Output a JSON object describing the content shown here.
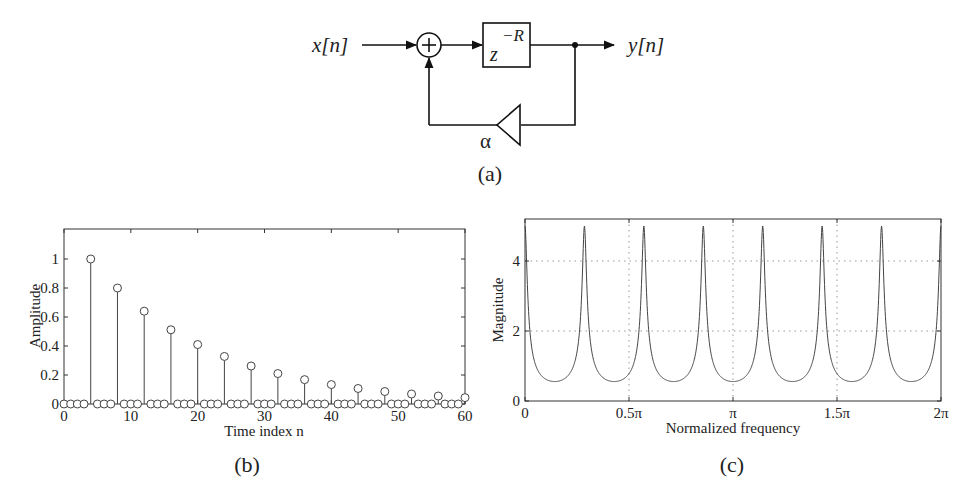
{
  "diagram": {
    "input_label": "x[n]",
    "output_label": "y[n]",
    "delay_label_base": "z",
    "delay_label_exp": "−R",
    "adder_symbol": "+",
    "gain_label": "α",
    "caption": "(a)"
  },
  "panel_b": {
    "caption": "(b)",
    "xlabel": "Time index n",
    "ylabel": "Amplitude",
    "xticks": [
      "0",
      "10",
      "20",
      "30",
      "40",
      "50",
      "60"
    ],
    "yticks": [
      "0",
      "0.2",
      "0.4",
      "0.6",
      "0.8",
      "1"
    ]
  },
  "panel_c": {
    "caption": "(c)",
    "xlabel": "Normalized frequency",
    "ylabel": "Magnitude",
    "xticks": [
      "0",
      "0.5π",
      "π",
      "1.5π",
      "2π"
    ],
    "yticks": [
      "0",
      "2",
      "4"
    ]
  },
  "chart_data": [
    {
      "type": "stem",
      "title": "(b)",
      "xlabel": "Time index n",
      "ylabel": "Amplitude",
      "xlim": [
        0,
        60
      ],
      "ylim": [
        0,
        1.2
      ],
      "xticks": [
        0,
        10,
        20,
        30,
        40,
        50,
        60
      ],
      "yticks": [
        0,
        0.2,
        0.4,
        0.6,
        0.8,
        1
      ],
      "grid": false,
      "x": [
        0,
        1,
        2,
        3,
        4,
        5,
        6,
        7,
        8,
        9,
        10,
        11,
        12,
        13,
        14,
        15,
        16,
        17,
        18,
        19,
        20,
        21,
        22,
        23,
        24,
        25,
        26,
        27,
        28,
        29,
        30,
        31,
        32,
        33,
        34,
        35,
        36,
        37,
        38,
        39,
        40,
        41,
        42,
        43,
        44,
        45,
        46,
        47,
        48,
        49,
        50,
        51,
        52,
        53,
        54,
        55,
        56,
        57,
        58,
        59,
        60
      ],
      "values": [
        0,
        0,
        0,
        0,
        1,
        0,
        0,
        0,
        0.8,
        0,
        0,
        0,
        0.64,
        0,
        0,
        0,
        0.512,
        0,
        0,
        0,
        0.41,
        0,
        0,
        0,
        0.328,
        0,
        0,
        0,
        0.262,
        0,
        0,
        0,
        0.21,
        0,
        0,
        0,
        0.168,
        0,
        0,
        0,
        0.134,
        0,
        0,
        0,
        0.107,
        0,
        0,
        0,
        0.086,
        0,
        0,
        0,
        0.069,
        0,
        0,
        0,
        0.055,
        0,
        0,
        0,
        0.044
      ]
    },
    {
      "type": "line",
      "title": "(c)",
      "xlabel": "Normalized frequency",
      "ylabel": "Magnitude",
      "xlim": [
        0,
        6.2832
      ],
      "ylim": [
        0,
        5.2
      ],
      "xticks": [
        "0",
        "0.5π",
        "π",
        "1.5π",
        "2π"
      ],
      "yticks": [
        0,
        2,
        4
      ],
      "grid": true,
      "series": [
        {
          "name": "|H(e^jw)|",
          "formula": "1/|1 - 0.8 e^{-j7w}|",
          "peaks_at": [
            "0",
            "2π/7",
            "4π/7",
            "6π/7",
            "8π/7",
            "10π/7",
            "12π/7",
            "2π"
          ],
          "peak_value": 5.0,
          "min_value": 0.556,
          "R": 7,
          "alpha": 0.8
        }
      ]
    }
  ]
}
